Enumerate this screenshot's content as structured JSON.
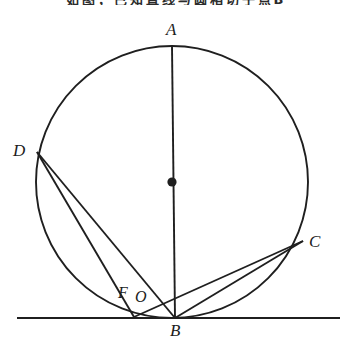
{
  "header": {
    "text": "如图，已知直线与圆相切于点B"
  },
  "figure": {
    "stroke_color": "#1f1f1f",
    "background_color": "#ffffff",
    "circle": {
      "center_x": 172,
      "center_y": 182,
      "radius": 136,
      "center_dot_radius": 4.5
    },
    "points": {
      "A": {
        "label": "A",
        "x": 172,
        "y": 46
      },
      "B": {
        "label": "B",
        "x": 175,
        "y": 318
      },
      "C": {
        "label": "C",
        "x": 303,
        "y": 241
      },
      "D": {
        "label": "D",
        "x": 37,
        "y": 152
      },
      "F": {
        "label": "F",
        "x": 134,
        "y": 317
      },
      "O": {
        "label": "O",
        "x": 172,
        "y": 182
      }
    },
    "tangent_line": {
      "name": "tangent-line",
      "x1": 17,
      "y1": 318,
      "x2": 340,
      "y2": 318
    },
    "segments": [
      {
        "name": "segment-AB",
        "from": "A",
        "to": "B"
      },
      {
        "name": "segment-DF",
        "from": "D",
        "to": "F"
      },
      {
        "name": "segment-DB",
        "from": "D",
        "to": "B"
      },
      {
        "name": "segment-FC",
        "from": "F",
        "to": "C"
      },
      {
        "name": "segment-BC",
        "from": "B",
        "to": "C"
      }
    ]
  }
}
